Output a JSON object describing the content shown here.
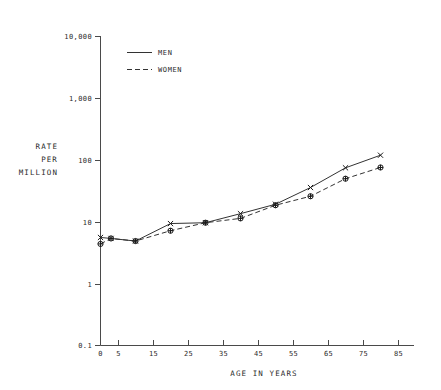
{
  "chart_data": {
    "type": "line",
    "title": "",
    "xlabel": "AGE IN YEARS",
    "ylabel": "RATE PER MILLION",
    "ylabel_lines": [
      "RATE",
      "PER",
      "MILLION"
    ],
    "yscale": "log",
    "xscale": "linear",
    "ylim": [
      0.1,
      10000
    ],
    "xlim": [
      0,
      88
    ],
    "grid": false,
    "legend_position": "top-left-inside",
    "x_ticks": [
      0,
      5,
      15,
      25,
      35,
      45,
      55,
      65,
      75,
      85
    ],
    "x_tick_labels": [
      "0",
      "5",
      "15",
      "25",
      "35",
      "45",
      "55",
      "65",
      "75",
      "85"
    ],
    "y_ticks": [
      0.1,
      1,
      10,
      100,
      1000,
      10000
    ],
    "y_tick_labels": [
      "0.1",
      "1",
      "10",
      "100",
      "1,000",
      "10,000"
    ],
    "x": [
      0,
      3,
      10,
      20,
      30,
      40,
      50,
      60,
      70,
      80
    ],
    "series": [
      {
        "name": "MEN",
        "style": "solid",
        "marker": "x",
        "values": [
          5.6,
          5.4,
          4.9,
          9.4,
          9.7,
          13.6,
          19.3,
          36.0,
          75.0,
          120.0
        ]
      },
      {
        "name": "WOMEN",
        "style": "dashed",
        "marker": "circle-plus",
        "values": [
          4.4,
          5.4,
          4.9,
          7.2,
          9.7,
          11.4,
          18.6,
          26.0,
          50.0,
          76.0
        ]
      }
    ],
    "colors": {
      "axis": "#4a4a4a",
      "men": "#333333",
      "women": "#333333",
      "text": "#2b2b2b",
      "background": "#ffffff"
    }
  },
  "legend": {
    "items": [
      {
        "label": "MEN",
        "style": "solid"
      },
      {
        "label": "WOMEN",
        "style": "dashed"
      }
    ]
  }
}
